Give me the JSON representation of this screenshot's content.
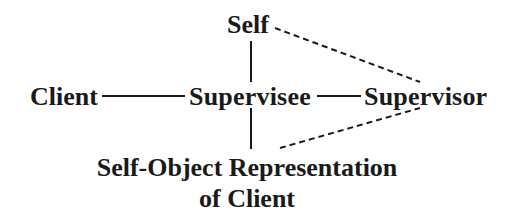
{
  "diagram": {
    "type": "supervision-relationship-diagram",
    "nodes": {
      "self": {
        "label": "Self"
      },
      "client": {
        "label": "Client"
      },
      "supervisee": {
        "label": "Supervisee"
      },
      "supervisor": {
        "label": "Supervisor"
      },
      "self_object": {
        "label_line1": "Self-Object Representation",
        "label_line2": "of Client"
      }
    },
    "edges": [
      {
        "from": "client",
        "to": "supervisee",
        "style": "solid"
      },
      {
        "from": "supervisee",
        "to": "supervisor",
        "style": "solid"
      },
      {
        "from": "self",
        "to": "supervisee",
        "style": "solid"
      },
      {
        "from": "supervisee",
        "to": "self_object",
        "style": "solid"
      },
      {
        "from": "self",
        "to": "supervisor",
        "style": "dashed"
      },
      {
        "from": "self_object",
        "to": "supervisor",
        "style": "dashed"
      }
    ],
    "colors": {
      "ink": "#1a1a1a",
      "background": "#ffffff"
    }
  }
}
